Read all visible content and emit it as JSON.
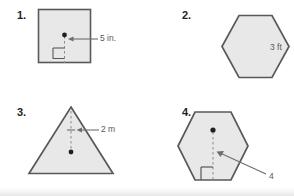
{
  "page": {
    "background_color": "#ffffff",
    "shape_fill": "#e8e8e8",
    "shape_stroke": "#58595b",
    "label_color": "#58595b",
    "number_color": "#231f20"
  },
  "problems": [
    {
      "number": "1.",
      "shape": "square",
      "measure_label": "5 in.",
      "units": "in.",
      "value": "5",
      "has_dot": true,
      "has_right_angle_mark": true,
      "has_arrow": true,
      "has_dashed_segment": true
    },
    {
      "number": "2.",
      "shape": "hexagon",
      "measure_label": "3 ft",
      "units": "ft",
      "value": "3",
      "has_dot": false,
      "has_right_angle_mark": false,
      "has_arrow": false,
      "has_dashed_segment": false
    },
    {
      "number": "3.",
      "shape": "triangle",
      "measure_label": "2 m",
      "units": "m",
      "value": "2",
      "has_dot": true,
      "has_right_angle_mark": false,
      "has_arrow": true,
      "has_dashed_segment": true
    },
    {
      "number": "4.",
      "shape": "hexagon",
      "measure_label": "4",
      "units": "",
      "value": "4",
      "has_dot": true,
      "has_right_angle_mark": true,
      "has_arrow": true,
      "has_dashed_segment": true
    }
  ]
}
